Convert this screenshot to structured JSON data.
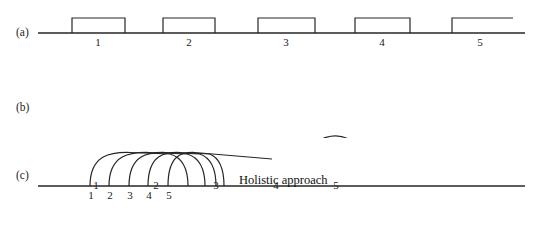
{
  "figure": {
    "width": 541,
    "height": 227,
    "background": "#ffffff",
    "line_color": "#262626",
    "text_color": "#1a1a1a"
  },
  "panels": [
    {
      "id": "a",
      "label": "(a)",
      "style_name": "sequential-rectangular-pulses",
      "baseline": {
        "x1": 38,
        "x2": 525,
        "y": 33
      },
      "pulse_top_y": 18,
      "pulses": [
        {
          "number": "1",
          "x_start": 72,
          "x_end": 125,
          "closed": true
        },
        {
          "number": "2",
          "x_start": 163,
          "x_end": 215,
          "closed": true
        },
        {
          "number": "3",
          "x_start": 258,
          "x_end": 315,
          "closed": true
        },
        {
          "number": "4",
          "x_start": 355,
          "x_end": 410,
          "closed": true
        },
        {
          "number": "5",
          "x_start": 452,
          "x_end": 513,
          "closed": false
        }
      ],
      "tick_labels": [
        {
          "text": "1",
          "center_x": 98
        },
        {
          "text": "2",
          "center_x": 189
        },
        {
          "text": "3",
          "center_x": 286
        },
        {
          "text": "4",
          "center_x": 382
        },
        {
          "text": "5",
          "center_x": 480
        }
      ],
      "tick_label_y": 36
    },
    {
      "id": "b",
      "label": "(b)",
      "style_name": "contiguous-semicircular-arches",
      "baseline": {
        "x1": 38,
        "x2": 525,
        "y": 108
      },
      "arch_height": 30,
      "arches": [
        {
          "number": "1",
          "x_start": 66,
          "x_end": 126,
          "closed": true
        },
        {
          "number": "2",
          "x_start": 126,
          "x_end": 186,
          "closed": true
        },
        {
          "number": "3",
          "x_start": 186,
          "x_end": 246,
          "closed": true
        },
        {
          "number": "4",
          "x_start": 246,
          "x_end": 306,
          "closed": true
        },
        {
          "number": "5",
          "x_start": 306,
          "x_end": 366,
          "closed": false
        }
      ],
      "tick_labels": [
        {
          "text": "1",
          "center_x": 96
        },
        {
          "text": "2",
          "center_x": 156
        },
        {
          "text": "3",
          "center_x": 216
        },
        {
          "text": "4",
          "center_x": 276
        },
        {
          "text": "5",
          "center_x": 336
        }
      ],
      "tick_label_y": 111
    },
    {
      "id": "c",
      "label": "(c)",
      "style_name": "overlapping-arches-holistic",
      "baseline": {
        "x1": 38,
        "x2": 525,
        "y": 48
      },
      "arch_height": 34,
      "annotation": "Holistic approach",
      "arches": [
        {
          "number": "1",
          "x_start": 90,
          "x_end": 188,
          "closed": true
        },
        {
          "number": "2",
          "x_start": 109,
          "x_end": 205,
          "closed": true
        },
        {
          "number": "3",
          "x_start": 129,
          "x_end": 216,
          "closed": true
        },
        {
          "number": "4",
          "x_start": 148,
          "x_end": 224,
          "closed": true
        },
        {
          "number": "5",
          "x_start": 168,
          "x_end": 232,
          "closed": false
        }
      ],
      "tick_labels": [
        {
          "text": "1",
          "center_x": 91
        },
        {
          "text": "2",
          "center_x": 110
        },
        {
          "text": "3",
          "center_x": 130
        },
        {
          "text": "4",
          "center_x": 149
        },
        {
          "text": "5",
          "center_x": 169
        }
      ],
      "tick_label_y": 51
    }
  ]
}
